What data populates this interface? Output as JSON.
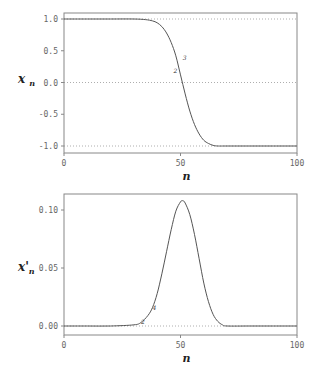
{
  "chart_data": [
    {
      "type": "line",
      "title": "",
      "xlabel": "n",
      "ylabel": "x_n",
      "xlim": [
        0,
        100
      ],
      "ylim": [
        -1.1,
        1.05
      ],
      "xticks": [
        "0",
        "50",
        "100"
      ],
      "yticks": [
        "1.0",
        "0.5",
        "0.0",
        "-0.5",
        "-1.0"
      ],
      "reference_lines": [
        1.0,
        0.0,
        -1.0
      ],
      "annotations": [
        {
          "text": "3",
          "x": 51,
          "y": 0.35
        },
        {
          "text": "2",
          "x": 47,
          "y": 0.15
        }
      ],
      "x": [
        0,
        10,
        20,
        30,
        35,
        38,
        40,
        42,
        44,
        46,
        48,
        50,
        52,
        54,
        56,
        58,
        60,
        62,
        64,
        66,
        70,
        80,
        90,
        100
      ],
      "values": [
        1.0,
        1.0,
        1.0,
        1.0,
        0.99,
        0.97,
        0.94,
        0.88,
        0.78,
        0.63,
        0.42,
        0.12,
        -0.18,
        -0.45,
        -0.66,
        -0.81,
        -0.91,
        -0.96,
        -0.99,
        -1.0,
        -1.0,
        -1.0,
        -1.0,
        -1.0
      ]
    },
    {
      "type": "line",
      "title": "",
      "xlabel": "n",
      "ylabel": "x'_n",
      "xlim": [
        0,
        100
      ],
      "ylim": [
        -0.005,
        0.115
      ],
      "xticks": [
        "0",
        "50",
        "100"
      ],
      "yticks": [
        "0.10",
        "0.05",
        "0.00"
      ],
      "reference_lines": [
        0.0
      ],
      "annotations": [
        {
          "text": "2",
          "x": 33,
          "y": 0.002
        },
        {
          "text": "4",
          "x": 38,
          "y": 0.014
        }
      ],
      "x": [
        0,
        10,
        20,
        30,
        33,
        36,
        38,
        40,
        42,
        44,
        46,
        48,
        50,
        51,
        52,
        54,
        56,
        58,
        60,
        62,
        64,
        66,
        68,
        70,
        80,
        90,
        100
      ],
      "values": [
        0.0,
        0.0,
        0.0,
        0.001,
        0.003,
        0.009,
        0.016,
        0.028,
        0.045,
        0.064,
        0.083,
        0.099,
        0.107,
        0.108,
        0.106,
        0.096,
        0.079,
        0.058,
        0.037,
        0.021,
        0.01,
        0.004,
        0.001,
        0.0,
        0.0,
        0.0,
        0.0
      ]
    }
  ]
}
